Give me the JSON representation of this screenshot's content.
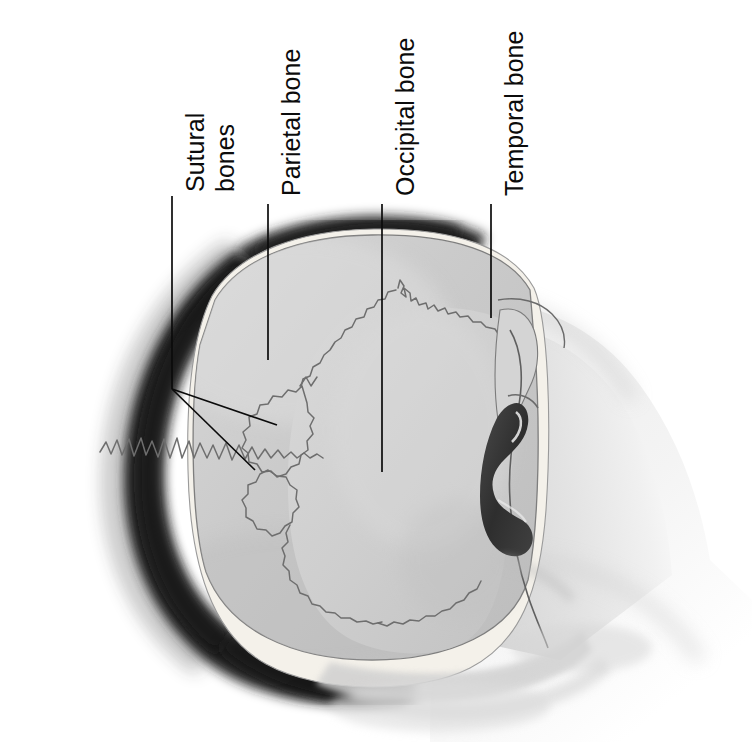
{
  "figure": {
    "view": "Top-down (superior) view of the human head showing cranial bones and sutures",
    "background_color": "#ffffff",
    "ink_color": "#0b0b0b"
  },
  "palette": {
    "hair_dark": "#262626",
    "hair_core": "#1a1a1a",
    "rim_light": "#f2efe9",
    "cranium_gray": "#c9c9c9",
    "cranium_light": "#d8d8d8",
    "occipital_gray": "#cfcfcf",
    "suture_line": "#6e6e6e",
    "ear_shadow": "#3a3a3a",
    "skin_light": "#e8e8e8",
    "neck_gray": "#dcdcdc",
    "leader_line": "#0b0b0b"
  },
  "labels": [
    {
      "id": "sutural-bones",
      "text_line1": "Sutural",
      "text_line2": "bones",
      "full_text": "Sutural bones",
      "orientation": "rotated-90-ccw",
      "two_line": true,
      "leader": {
        "type": "forked",
        "vertical_from": [
          172,
          196
        ],
        "vertical_to": [
          172,
          389
        ],
        "branches": [
          {
            "to": [
              277,
              425
            ]
          },
          {
            "to": [
              255,
              470
            ]
          }
        ]
      }
    },
    {
      "id": "parietal-bone",
      "full_text": "Parietal bone",
      "orientation": "rotated-90-ccw",
      "two_line": false,
      "leader": {
        "type": "straight",
        "vertical_from": [
          268,
          204
        ],
        "vertical_to": [
          268,
          360
        ]
      }
    },
    {
      "id": "occipital-bone",
      "full_text": "Occipital bone",
      "orientation": "rotated-90-ccw",
      "two_line": false,
      "leader": {
        "type": "straight",
        "vertical_from": [
          382,
          204
        ],
        "vertical_to": [
          382,
          472
        ]
      }
    },
    {
      "id": "temporal-bone",
      "full_text": "Temporal bone",
      "orientation": "rotated-90-ccw",
      "two_line": false,
      "leader": {
        "type": "straight",
        "vertical_from": [
          491,
          204
        ],
        "vertical_to": [
          491,
          318
        ]
      }
    }
  ],
  "anatomy_parts": [
    {
      "name": "hair-mass",
      "description": "Dark hair band around posterior and left of cranium"
    },
    {
      "name": "cranial-vault",
      "description": "Large gray parietal dome"
    },
    {
      "name": "occipital-bone-region",
      "description": "Lighter gray region bounded by lambdoid suture"
    },
    {
      "name": "lambdoid-suture",
      "description": "Wavy suture between parietal and occipital bones"
    },
    {
      "name": "sagittal-suture",
      "description": "Horizontal wavy suture on left side of vault"
    },
    {
      "name": "sutural-bone-a",
      "description": "Small wormian bone within lambdoid suture"
    },
    {
      "name": "sutural-bone-b",
      "description": "Second small wormian bone lower in suture"
    },
    {
      "name": "temporal-bone-region",
      "description": "Right lateral bone near ear"
    },
    {
      "name": "ear-shadow",
      "description": "Dark S-shaped ear shadow on right margin"
    },
    {
      "name": "neck-shoulder",
      "description": "Pale gray neck and shoulder gradient at right"
    }
  ]
}
